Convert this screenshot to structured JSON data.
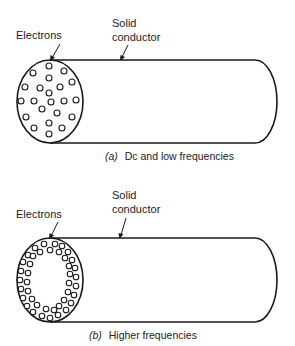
{
  "figure": {
    "panels": [
      {
        "id": "a",
        "labels": {
          "electrons": "Electrons",
          "conductor_line1": "Solid",
          "conductor_line2": "conductor"
        },
        "caption": {
          "letter": "(a)",
          "text": "Dc and low frequencies"
        },
        "electron_distribution": "uniform throughout cross-section"
      },
      {
        "id": "b",
        "labels": {
          "electrons": "Electrons",
          "conductor_line1": "Solid",
          "conductor_line2": "conductor"
        },
        "caption": {
          "letter": "(b)",
          "text": "Higher frequencies"
        },
        "electron_distribution": "concentrated near outer surface (skin effect)"
      }
    ]
  }
}
